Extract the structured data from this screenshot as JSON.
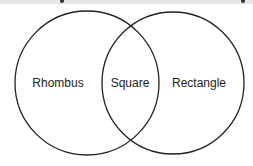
{
  "diagram": {
    "type": "venn",
    "sets": [
      {
        "label": "Rhombus",
        "cx": 87,
        "cy": 83,
        "r": 72
      },
      {
        "label": "Rectangle",
        "cx": 173,
        "cy": 83,
        "r": 71
      }
    ],
    "intersection_label": "Square",
    "stroke_color": "#222222"
  }
}
